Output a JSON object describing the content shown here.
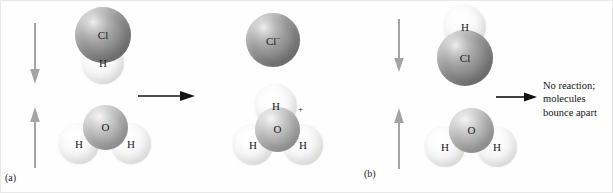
{
  "figure": {
    "background_color": "#fefefe",
    "atom_colors": {
      "chlorine": "#8b8b8b",
      "oxygen": "#b4b4b4",
      "hydrogen": "#f6f6f6"
    },
    "arrow_colors": {
      "motion_arrow": "#a0a0a0",
      "reaction_arrow": "#111111"
    }
  },
  "panel_a": {
    "label": "(a)",
    "reactants": {
      "hcl": {
        "chlorine_label": "Cl",
        "hydrogen_label": "H"
      },
      "water": {
        "oxygen_label": "O",
        "hydrogen_left_label": "H",
        "hydrogen_right_label": "H"
      }
    },
    "motion_arrows": {
      "top_direction": "down",
      "bottom_direction": "up"
    },
    "reaction_arrow_direction": "right",
    "products": {
      "chloride_ion": {
        "symbol": "Cl",
        "charge": "–"
      },
      "hydronium_ion": {
        "oxygen_label": "O",
        "hydrogen_top_label": "H",
        "hydrogen_left_label": "H",
        "hydrogen_right_label": "H",
        "charge": "+"
      }
    }
  },
  "panel_b": {
    "label": "(b)",
    "reactants": {
      "hcl": {
        "hydrogen_label": "H",
        "chlorine_label": "Cl"
      },
      "water": {
        "oxygen_label": "O",
        "hydrogen_left_label": "H",
        "hydrogen_right_label": "H"
      }
    },
    "motion_arrows": {
      "top_direction": "down",
      "bottom_direction": "up"
    },
    "outcome_arrow_direction": "right",
    "outcome_text": {
      "line1": "No reaction;",
      "line2": "molecules",
      "line3": "bounce apart"
    }
  }
}
